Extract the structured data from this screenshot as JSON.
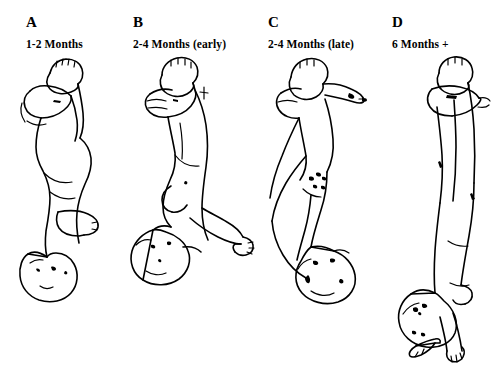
{
  "figure": {
    "background_color": "#ffffff",
    "ink_color": "#000000",
    "title": "",
    "panel_count": 4
  },
  "panels": [
    {
      "letter": "A",
      "caption": "1-2 Months",
      "pose": "fully flexed, trunk and limbs curled, head rounded at bottom"
    },
    {
      "letter": "B",
      "caption": "2-4 Months (early)",
      "pose": "partial extension, one leg extended outward, head tilted to the side"
    },
    {
      "letter": "C",
      "caption": "2-4 Months (late)",
      "pose": "arms extended overhead alongside the trunk, increased extension, head at bottom"
    },
    {
      "letter": "D",
      "caption": "6 Months +",
      "pose": "full extension, trunk straight, arms hanging down past the head"
    }
  ]
}
